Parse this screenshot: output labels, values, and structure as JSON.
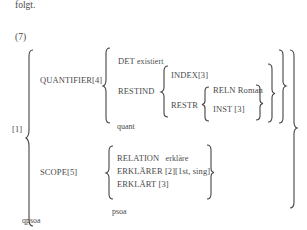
{
  "text_before": "folgt.",
  "example_number": "(7)",
  "avm": {
    "tag": "[1]",
    "type": "qpsoa",
    "quantifier": {
      "label": "QUANTIFIER[4]",
      "type": "quant",
      "det_label": "DET",
      "det_value": "existiert",
      "restind": {
        "label": "RESTIND",
        "index": "INDEX[3]",
        "restr": {
          "label": "RESTR",
          "reln_label": "RELN",
          "reln_value": "Roman",
          "inst": "INST [3]"
        }
      }
    },
    "scope": {
      "label": "SCOPE[5]",
      "type": "psoa",
      "relation_label": "RELATION",
      "relation_value": "erkläre",
      "erklaerer": "ERKLÄRER [2][1st, sing]",
      "erklaert": "ERKLÄRT [3]"
    }
  }
}
